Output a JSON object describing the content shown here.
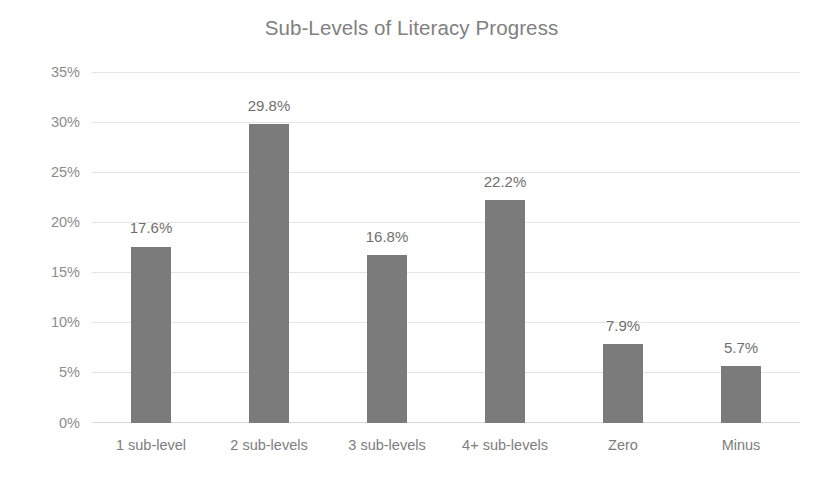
{
  "chart_data": {
    "type": "bar",
    "title": "Sub-Levels of Literacy Progress",
    "xlabel": "",
    "ylabel": "",
    "categories": [
      "1 sub-level",
      "2 sub-levels",
      "3 sub-levels",
      "4+ sub-levels",
      "Zero",
      "Minus"
    ],
    "values": [
      17.6,
      29.8,
      16.8,
      22.2,
      7.9,
      5.7
    ],
    "value_labels": [
      "17.6%",
      "29.8%",
      "16.8%",
      "22.2%",
      "7.9%",
      "5.7%"
    ],
    "ylim": [
      0,
      35
    ],
    "ytick_values": [
      35,
      30,
      25,
      20,
      15,
      10,
      5,
      0
    ],
    "ytick_labels": [
      "35%",
      "30%",
      "25%",
      "20%",
      "15%",
      "10%",
      "5%",
      "0%"
    ],
    "grid": true,
    "legend": false,
    "bar_color": "#7b7b7b",
    "gridline_color": "#e4e4e4",
    "text_color": "#808080",
    "background": "#ffffff"
  }
}
